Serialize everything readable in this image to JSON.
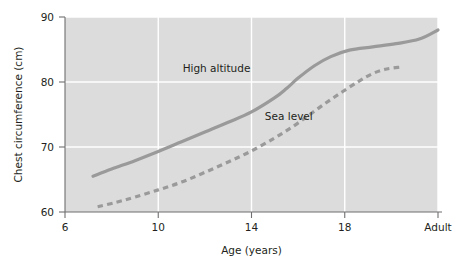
{
  "chart_data": {
    "type": "line",
    "title": "",
    "xlabel": "Age (years)",
    "ylabel": "Chest circumference (cm)",
    "xlim": [
      6,
      22
    ],
    "ylim": [
      60,
      90
    ],
    "grid": true,
    "legend": "inline-labels",
    "x_ticks": [
      {
        "value": 6,
        "label": "6"
      },
      {
        "value": 10,
        "label": "10"
      },
      {
        "value": 14,
        "label": "14"
      },
      {
        "value": 18,
        "label": "18"
      },
      {
        "value": 22,
        "label": "Adult"
      }
    ],
    "y_ticks": [
      {
        "value": 60,
        "label": "60"
      },
      {
        "value": 70,
        "label": "70"
      },
      {
        "value": 80,
        "label": "80"
      },
      {
        "value": 90,
        "label": "90"
      }
    ],
    "series": [
      {
        "name": "High altitude",
        "style": "solid",
        "color": "#9a9a9a",
        "label_x": 12.5,
        "label_y": 81.6,
        "points": [
          {
            "x": 7.2,
            "y": 65.5
          },
          {
            "x": 8.0,
            "y": 66.6
          },
          {
            "x": 9.0,
            "y": 67.9
          },
          {
            "x": 10.0,
            "y": 69.3
          },
          {
            "x": 11.0,
            "y": 70.8
          },
          {
            "x": 12.0,
            "y": 72.3
          },
          {
            "x": 13.0,
            "y": 73.8
          },
          {
            "x": 14.0,
            "y": 75.4
          },
          {
            "x": 15.0,
            "y": 77.6
          },
          {
            "x": 15.5,
            "y": 79.0
          },
          {
            "x": 16.0,
            "y": 80.6
          },
          {
            "x": 16.7,
            "y": 82.5
          },
          {
            "x": 17.4,
            "y": 83.9
          },
          {
            "x": 18.2,
            "y": 84.9
          },
          {
            "x": 19.2,
            "y": 85.4
          },
          {
            "x": 20.2,
            "y": 85.9
          },
          {
            "x": 21.2,
            "y": 86.6
          },
          {
            "x": 22.0,
            "y": 88.0
          }
        ]
      },
      {
        "name": "Sea level",
        "style": "dashed",
        "color": "#9a9a9a",
        "label_x": 15.6,
        "label_y": 74.2,
        "points": [
          {
            "x": 7.4,
            "y": 60.8
          },
          {
            "x": 8.2,
            "y": 61.5
          },
          {
            "x": 9.0,
            "y": 62.3
          },
          {
            "x": 10.0,
            "y": 63.4
          },
          {
            "x": 11.0,
            "y": 64.6
          },
          {
            "x": 12.0,
            "y": 66.1
          },
          {
            "x": 13.0,
            "y": 67.7
          },
          {
            "x": 14.0,
            "y": 69.4
          },
          {
            "x": 15.0,
            "y": 71.4
          },
          {
            "x": 15.8,
            "y": 73.2
          },
          {
            "x": 16.5,
            "y": 75.0
          },
          {
            "x": 17.2,
            "y": 76.8
          },
          {
            "x": 17.9,
            "y": 78.5
          },
          {
            "x": 18.6,
            "y": 80.1
          },
          {
            "x": 19.2,
            "y": 81.3
          },
          {
            "x": 19.8,
            "y": 82.0
          },
          {
            "x": 20.4,
            "y": 82.3
          }
        ]
      }
    ]
  },
  "plot": {
    "left": 65,
    "right": 438,
    "top": 17,
    "bottom": 212
  }
}
